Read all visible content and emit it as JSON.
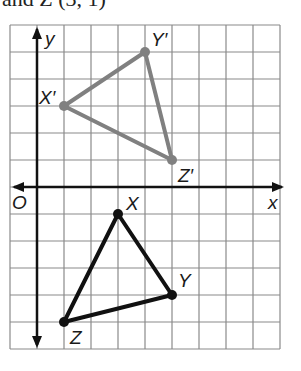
{
  "caption": "and Z (3, 1)",
  "graph": {
    "x_axis_label": "x",
    "y_axis_label": "y",
    "origin_label": "O",
    "grid": {
      "left": 10,
      "top": 25,
      "cols": 10,
      "rows": 12,
      "cell": 27.0,
      "origin_col": 1,
      "origin_row": 6
    },
    "colors": {
      "grid": "#8a8a8a",
      "axis": "#111111",
      "image": "#808080",
      "preimage": "#111111"
    }
  },
  "preimage": {
    "name": "triangle XYZ",
    "vertices": [
      {
        "label": "X",
        "x": 3,
        "y": -1
      },
      {
        "label": "Y",
        "x": 5,
        "y": -4
      },
      {
        "label": "Z",
        "x": 1,
        "y": -5
      }
    ]
  },
  "image": {
    "name": "triangle X'Y'Z'",
    "vertices": [
      {
        "label": "X′",
        "x": 1,
        "y": 3
      },
      {
        "label": "Y′",
        "x": 4,
        "y": 5
      },
      {
        "label": "Z′",
        "x": 5,
        "y": 1
      }
    ]
  }
}
